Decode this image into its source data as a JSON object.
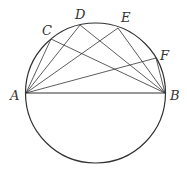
{
  "diagram": {
    "type": "geometry",
    "circle": {
      "cx": 95.5,
      "cy": 93,
      "r": 70
    },
    "points": [
      {
        "name": "A",
        "x": 26,
        "y": 93,
        "lx": 10,
        "ly": 100
      },
      {
        "name": "B",
        "x": 165,
        "y": 93,
        "lx": 170,
        "ly": 100
      },
      {
        "name": "C",
        "x": 51,
        "y": 39,
        "lx": 42,
        "ly": 35
      },
      {
        "name": "D",
        "x": 80,
        "y": 25,
        "lx": 75,
        "ly": 19
      },
      {
        "name": "E",
        "x": 118,
        "y": 28,
        "lx": 121,
        "ly": 22
      },
      {
        "name": "F",
        "x": 156,
        "y": 58,
        "lx": 160,
        "ly": 60
      }
    ],
    "segments": [
      [
        "A",
        "B"
      ],
      [
        "A",
        "C"
      ],
      [
        "A",
        "D"
      ],
      [
        "A",
        "E"
      ],
      [
        "A",
        "F"
      ],
      [
        "B",
        "C"
      ],
      [
        "B",
        "D"
      ],
      [
        "B",
        "E"
      ],
      [
        "B",
        "F"
      ]
    ],
    "stroke_color": "#333333"
  }
}
